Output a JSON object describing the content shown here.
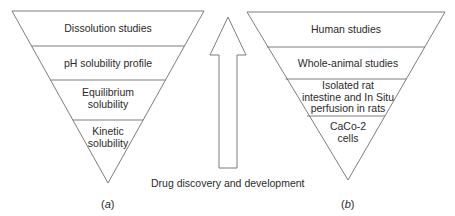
{
  "figure": {
    "panel_a": {
      "label_prefix": "(",
      "label_letter": "a",
      "label_suffix": ")",
      "tiers": [
        {
          "line1": "Dissolution studies",
          "line2": ""
        },
        {
          "line1": "pH solubility profile",
          "line2": ""
        },
        {
          "line1": "Equilibrium",
          "line2": "solubility"
        },
        {
          "line1": "Kinetic",
          "line2": "solubility"
        }
      ]
    },
    "panel_b": {
      "label_prefix": "(",
      "label_letter": "b",
      "label_suffix": ")",
      "tiers": [
        {
          "line1": "Human studies",
          "line2": "",
          "line3": ""
        },
        {
          "line1": "Whole-animal studies",
          "line2": "",
          "line3": ""
        },
        {
          "line1": "Isolated rat",
          "line2": "intestine and In Situ",
          "line3": "perfusion in rats"
        },
        {
          "line1": "CaCo-2",
          "line2": "cells",
          "line3": ""
        }
      ]
    },
    "arrow": {
      "caption": "Drug discovery and development",
      "direction": "up"
    },
    "colors": {
      "stroke": "#6e6e6e",
      "text": "#2a2a2a",
      "background": "#ffffff"
    }
  }
}
